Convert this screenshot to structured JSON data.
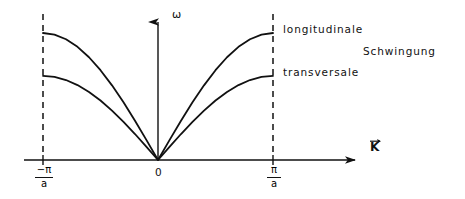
{
  "figure": {
    "background_color": "#ffffff",
    "line_color": "#111111"
  },
  "axes": {
    "y_label": "ω",
    "x_label": "K",
    "x_label_is_vector": true,
    "origin_label": "0",
    "x_ticks": [
      {
        "name": "left-zone-boundary",
        "numerator": "−π",
        "denominator": "a",
        "x_px": 43
      },
      {
        "name": "origin",
        "numerator": "0",
        "denominator": "",
        "x_px": 158
      },
      {
        "name": "right-zone-boundary",
        "numerator": "π",
        "denominator": "a",
        "x_px": 273
      }
    ]
  },
  "annotations": {
    "longitudinal": "longitudinale",
    "transversal": "transversale",
    "schwingung": "Schwingung"
  },
  "chart_data": {
    "type": "line",
    "title": "",
    "xlabel": "K",
    "ylabel": "ω",
    "xlim": [
      -1,
      1
    ],
    "ylim": [
      0,
      1
    ],
    "grid": false,
    "legend": "inline-right",
    "x_tick_labels": [
      "-π/a",
      "0",
      "π/a"
    ],
    "x_tick_values": [
      -1,
      0,
      1
    ],
    "x": [
      -1,
      -0.9,
      -0.8,
      -0.7,
      -0.6,
      -0.5,
      -0.4,
      -0.3,
      -0.2,
      -0.1,
      0,
      0.1,
      0.2,
      0.3,
      0.4,
      0.5,
      0.6,
      0.7,
      0.8,
      0.9,
      1
    ],
    "series": [
      {
        "name": "longitudinale",
        "formula": "omega = omega_L * |sin(K a / 2)|",
        "peak_value": 1.0,
        "values": [
          1.0,
          0.9877,
          0.9511,
          0.891,
          0.809,
          0.7071,
          0.5878,
          0.454,
          0.309,
          0.1564,
          0.0,
          0.1564,
          0.309,
          0.454,
          0.5878,
          0.7071,
          0.809,
          0.891,
          0.9511,
          0.9877,
          1.0
        ]
      },
      {
        "name": "transversale",
        "formula": "omega = omega_T * |sin(K a / 2)|",
        "peak_value": 0.662,
        "values": [
          0.662,
          0.6539,
          0.6297,
          0.5898,
          0.5356,
          0.4681,
          0.3891,
          0.3006,
          0.2046,
          0.1035,
          0.0,
          0.1035,
          0.2046,
          0.3006,
          0.3891,
          0.4681,
          0.5356,
          0.5898,
          0.6297,
          0.6539,
          0.662
        ]
      }
    ],
    "vertical_dashed_lines": [
      -1,
      1
    ]
  }
}
